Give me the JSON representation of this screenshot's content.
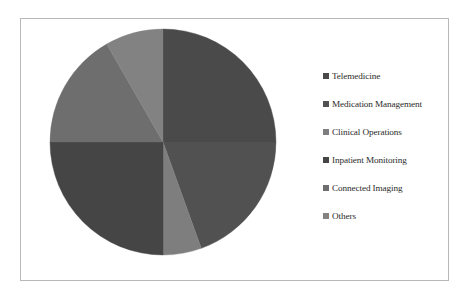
{
  "chart_data": {
    "type": "pie",
    "title": "",
    "subtitle": "",
    "xlabel": "",
    "ylabel": "",
    "grid": false,
    "legend_position": "right",
    "start_angle_deg": 0,
    "direction": "clockwise",
    "categories": [
      "Telemedicine",
      "Medication Management",
      "Clinical Operations",
      "Inpatient Monitoring",
      "Connected Imaging",
      "Others"
    ],
    "values": [
      25.0,
      19.5,
      5.5,
      25.0,
      16.7,
      8.3
    ],
    "value_unit": "%",
    "colors": [
      "#4a4a4a",
      "#515151",
      "#7e7e7e",
      "#454545",
      "#6e6e6e",
      "#828282"
    ],
    "slices": [
      {
        "label": "Telemedicine",
        "value": 25.0,
        "color": "#4a4a4a",
        "start_deg": 0.0,
        "end_deg": 90.0
      },
      {
        "label": "Medication Management",
        "value": 19.5,
        "color": "#515151",
        "start_deg": 90.0,
        "end_deg": 160.2
      },
      {
        "label": "Clinical Operations",
        "value": 5.5,
        "color": "#7e7e7e",
        "start_deg": 160.2,
        "end_deg": 180.0
      },
      {
        "label": "Inpatient Monitoring",
        "value": 25.0,
        "color": "#454545",
        "start_deg": 180.0,
        "end_deg": 270.0
      },
      {
        "label": "Connected Imaging",
        "value": 16.7,
        "color": "#6e6e6e",
        "start_deg": 270.0,
        "end_deg": 330.1
      },
      {
        "label": "Others",
        "value": 8.3,
        "color": "#828282",
        "start_deg": 330.1,
        "end_deg": 360.0
      }
    ],
    "data_labels_shown": false,
    "geometry": {
      "center_x": 120,
      "center_y": 115,
      "radius": 113
    }
  },
  "legend": {
    "items": [
      {
        "label": "Telemedicine",
        "color": "#4a4a4a"
      },
      {
        "label": "Medication Management",
        "color": "#515151"
      },
      {
        "label": "Clinical Operations",
        "color": "#7e7e7e"
      },
      {
        "label": "Inpatient Monitoring",
        "color": "#454545"
      },
      {
        "label": "Connected Imaging",
        "color": "#6e6e6e"
      },
      {
        "label": "Others",
        "color": "#828282"
      }
    ]
  },
  "frame": {
    "border_color": "#b8b8b8",
    "background_color": "#ffffff"
  }
}
